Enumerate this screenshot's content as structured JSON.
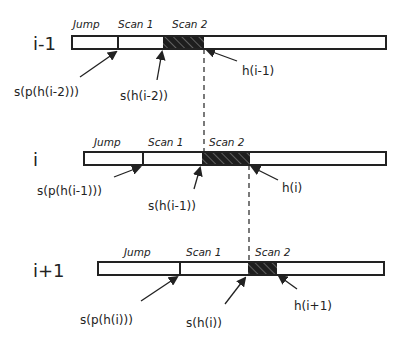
{
  "rows": [
    {
      "label": "i-1",
      "sections": [
        "Jump",
        "Scan 1",
        "Scan 2"
      ],
      "bar": {
        "x1": 72,
        "x2": 386,
        "y": 36,
        "h": 13,
        "divider": 118,
        "hatch_start": 163,
        "hatch_end": 204
      },
      "annotations": {
        "jump_start": "s(p(h(i-2)))",
        "scan_start": "s(h(i-2))",
        "head": "h(i-1)"
      }
    },
    {
      "label": "i",
      "sections": [
        "Jump",
        "Scan 1",
        "Scan 2"
      ],
      "bar": {
        "x1": 84,
        "x2": 386,
        "y": 152,
        "h": 13,
        "divider": 143,
        "hatch_start": 202,
        "hatch_end": 250
      },
      "annotations": {
        "jump_start": "s(p(h(i-1)))",
        "scan_start": "s(h(i-1))",
        "head": "h(i)"
      }
    },
    {
      "label": "i+1",
      "sections": [
        "Jump",
        "Scan 1",
        "Scan 2"
      ],
      "bar": {
        "x1": 98,
        "x2": 384,
        "y": 262,
        "h": 13,
        "divider": 180,
        "hatch_start": 247,
        "hatch_end": 277
      },
      "annotations": {
        "jump_start": "s(p(h(i)))",
        "scan_start": "s(h(i))",
        "head": "h(i+1)"
      }
    }
  ],
  "colors": {
    "stroke": "#222222",
    "hatch_bg": "#1e1e1e",
    "hatch_line": "#888888",
    "background": "#ffffff"
  }
}
